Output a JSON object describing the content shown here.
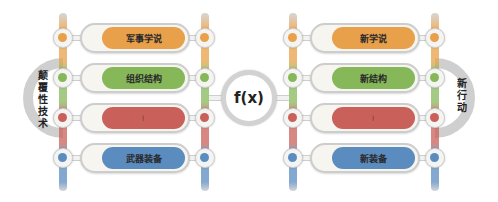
{
  "diagram": {
    "center": {
      "label": "f(x)"
    },
    "left_group": {
      "side_label": "颠覆性技术",
      "items": [
        {
          "label": "军事学说",
          "color": "#e8a04a"
        },
        {
          "label": "组织结构",
          "color": "#86b85a"
        },
        {
          "label": "⋮",
          "color": "#c9605a"
        },
        {
          "label": "武器装备",
          "color": "#5b8cc0"
        }
      ]
    },
    "right_group": {
      "side_label": "新行动",
      "items": [
        {
          "label": "新学说",
          "color": "#e8a04a"
        },
        {
          "label": "新结构",
          "color": "#86b85a"
        },
        {
          "label": "⋮",
          "color": "#c9605a"
        },
        {
          "label": "新装备",
          "color": "#5b8cc0"
        }
      ]
    },
    "colors": {
      "orange": "#e8a04a",
      "green": "#86b85a",
      "red": "#c9605a",
      "blue": "#5b8cc0",
      "frame_gray": "#cfcfcf"
    }
  }
}
